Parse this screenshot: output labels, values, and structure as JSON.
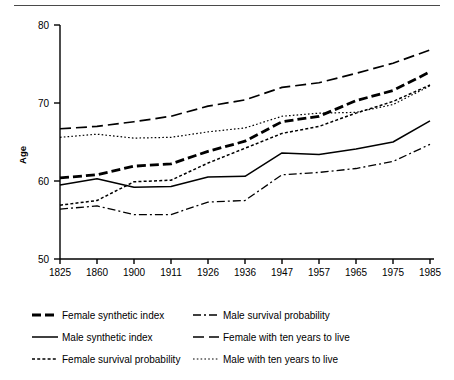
{
  "chart_data": {
    "type": "line",
    "title": "",
    "xlabel": "",
    "ylabel": "Age",
    "categories": [
      "1825",
      "1860",
      "1900",
      "1911",
      "1926",
      "1936",
      "1947",
      "1957",
      "1965",
      "1975",
      "1985"
    ],
    "ylim": [
      50,
      80
    ],
    "yticks": [
      50,
      60,
      70,
      80
    ],
    "grid": false,
    "legend_position": "bottom",
    "series": [
      {
        "name": "Female synthetic index",
        "style": "bold-dashed",
        "values": [
          60.4,
          60.8,
          61.9,
          62.2,
          63.8,
          65.1,
          67.6,
          68.3,
          70.3,
          71.6,
          74.0
        ]
      },
      {
        "name": "Male synthetic index",
        "style": "solid",
        "values": [
          59.5,
          60.3,
          59.2,
          59.3,
          60.5,
          60.6,
          63.6,
          63.4,
          64.1,
          65.0,
          67.7
        ]
      },
      {
        "name": "Female survival probability",
        "style": "dotted-dash",
        "values": [
          56.9,
          57.5,
          59.9,
          60.1,
          62.3,
          64.2,
          66.1,
          67.0,
          68.7,
          70.2,
          72.3
        ]
      },
      {
        "name": "Male survival probability",
        "style": "dash-dot",
        "values": [
          56.4,
          56.8,
          55.7,
          55.7,
          57.3,
          57.5,
          60.8,
          61.1,
          61.6,
          62.5,
          64.7
        ]
      },
      {
        "name": "Female with ten years to live",
        "style": "long-dashed",
        "values": [
          66.7,
          67.0,
          67.6,
          68.3,
          69.6,
          70.4,
          72.0,
          72.6,
          73.8,
          75.1,
          76.8
        ]
      },
      {
        "name": "Male with ten years to live",
        "style": "fine-dotted",
        "values": [
          65.6,
          66.0,
          65.5,
          65.6,
          66.3,
          66.8,
          68.3,
          68.7,
          68.8,
          69.8,
          72.2
        ]
      }
    ],
    "legend_entries": [
      {
        "label": "Female synthetic index",
        "style": "bold-dashed"
      },
      {
        "label": "Male survival probability",
        "style": "dash-dot"
      },
      {
        "label": "Male synthetic index",
        "style": "solid"
      },
      {
        "label": "Female with ten years to live",
        "style": "long-dashed"
      },
      {
        "label": "Female survival probability",
        "style": "dotted-dash"
      },
      {
        "label": "Male with ten years to live",
        "style": "fine-dotted"
      }
    ]
  }
}
